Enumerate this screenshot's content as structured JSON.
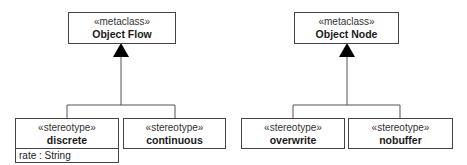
{
  "groups": [
    {
      "metaclass": {
        "stereotype": "«metaclass»",
        "name": "Object Flow"
      },
      "stereotypes": [
        {
          "stereotype": "«stereotype»",
          "name": "discrete",
          "attributes": [
            "rate : String"
          ]
        },
        {
          "stereotype": "«stereotype»",
          "name": "continuous",
          "attributes": []
        }
      ]
    },
    {
      "metaclass": {
        "stereotype": "«metaclass»",
        "name": "Object Node"
      },
      "stereotypes": [
        {
          "stereotype": "«stereotype»",
          "name": "overwrite",
          "attributes": []
        },
        {
          "stereotype": "«stereotype»",
          "name": "nobuffer",
          "attributes": []
        }
      ]
    }
  ],
  "colors": {
    "line": "#444444",
    "arrow": "#000000",
    "background": "#ffffff"
  }
}
